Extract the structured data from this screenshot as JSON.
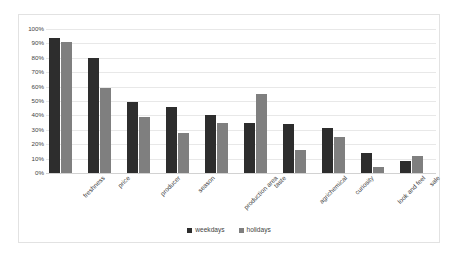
{
  "chart_data": {
    "type": "bar",
    "title": "",
    "subtitle": "",
    "xlabel": "",
    "ylabel": "",
    "ylim": [
      0,
      100
    ],
    "yticks": [
      "0%",
      "10%",
      "20%",
      "30%",
      "40%",
      "50%",
      "60%",
      "70%",
      "80%",
      "90%",
      "100%"
    ],
    "ytick_values": [
      0,
      10,
      20,
      30,
      40,
      50,
      60,
      70,
      80,
      90,
      100
    ],
    "grid": true,
    "legend_position": "bottom",
    "categories": [
      "freshness",
      "price",
      "producer",
      "season",
      "production area",
      "taste",
      "agrichemical",
      "curiosity",
      "look and feel",
      "sale"
    ],
    "series": [
      {
        "name": "weekdays",
        "color": "#2d2d2d",
        "values": [
          94,
          80,
          49,
          46,
          40,
          35,
          34,
          31,
          14,
          8
        ]
      },
      {
        "name": "holidays",
        "color": "#7f7f7f",
        "values": [
          91,
          59,
          39,
          28,
          35,
          55,
          16,
          25,
          4,
          12
        ]
      }
    ]
  }
}
